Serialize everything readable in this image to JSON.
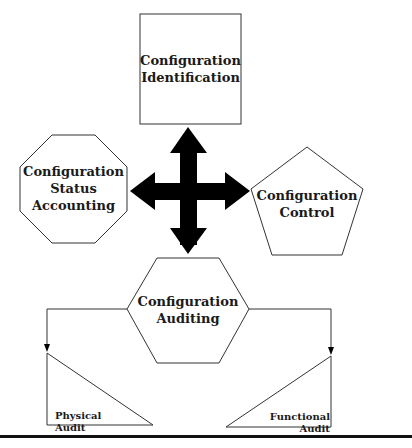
{
  "diagram": {
    "nodes": {
      "identification": {
        "lines": [
          "Configuration",
          "Identification"
        ],
        "shape": "square"
      },
      "status_accounting": {
        "lines": [
          "Configuration",
          "Status",
          "Accounting"
        ],
        "shape": "octagon"
      },
      "control": {
        "lines": [
          "Configuration",
          "Control"
        ],
        "shape": "pentagon"
      },
      "auditing": {
        "lines": [
          "Configuration",
          "Auditing"
        ],
        "shape": "hexagon"
      },
      "physical_audit": {
        "label": "Physical Audit",
        "shape": "right-triangle"
      },
      "functional_audit": {
        "label": "Functional Audit",
        "shape": "right-triangle"
      }
    },
    "connectors": {
      "center": "four-way-arrow",
      "auditing_to_physical": "arrow-down",
      "auditing_to_functional": "arrow-down"
    },
    "colors": {
      "stroke": "#333333",
      "arrow": "#000000",
      "text": "#1a1a1a",
      "rule": "#111111"
    }
  }
}
